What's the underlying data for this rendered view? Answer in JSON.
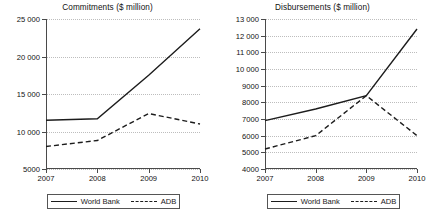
{
  "chart_data": [
    {
      "type": "line",
      "title": "Commitments ($ million)",
      "xlabel": "",
      "ylabel": "",
      "x": [
        "2007",
        "2008",
        "2009",
        "2010"
      ],
      "categories": [
        "2007",
        "2008",
        "2009",
        "2010"
      ],
      "ylim": [
        5000,
        25000
      ],
      "yticks": [
        5000,
        10000,
        15000,
        20000,
        25000
      ],
      "ytick_labels": [
        "5000",
        "10 000",
        "15 000",
        "20 000",
        "25 000"
      ],
      "grid": true,
      "legend_position": "bottom",
      "series": [
        {
          "name": "World Bank",
          "style": "solid",
          "values": [
            11500,
            11700,
            17500,
            23700
          ]
        },
        {
          "name": "ADB",
          "style": "dashed",
          "values": [
            8000,
            8800,
            12400,
            11000
          ]
        }
      ]
    },
    {
      "type": "line",
      "title": "Disbursements ($ million)",
      "xlabel": "",
      "ylabel": "",
      "x": [
        "2007",
        "2008",
        "2009",
        "2010"
      ],
      "categories": [
        "2007",
        "2008",
        "2009",
        "2010"
      ],
      "ylim": [
        4000,
        13000
      ],
      "yticks": [
        4000,
        5000,
        6000,
        7000,
        8000,
        9000,
        10000,
        11000,
        12000,
        13000
      ],
      "ytick_labels": [
        "4000",
        "5000",
        "6000",
        "7000",
        "8000",
        "9000",
        "10 000",
        "11 000",
        "12 000",
        "13 000"
      ],
      "grid": true,
      "legend_position": "bottom",
      "series": [
        {
          "name": "World Bank",
          "style": "solid",
          "values": [
            6900,
            7600,
            8400,
            12400
          ]
        },
        {
          "name": "ADB",
          "style": "dashed",
          "values": [
            5200,
            6000,
            8400,
            6000
          ]
        }
      ]
    }
  ],
  "colors": {
    "line": "#1c1c1c",
    "axis": "#4a4a4a",
    "grid": "#bdbdbd",
    "background": "#ffffff"
  }
}
